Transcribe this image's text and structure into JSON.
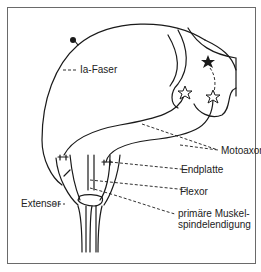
{
  "figure": {
    "labels": {
      "ia_faser": "Ia-Faser",
      "motoaxone": "Motoaxone",
      "endplatte": "Endplatte",
      "extensor": "Extensor",
      "flexor": "Flexor",
      "spindle_line1": "primäre Muskel-",
      "spindle_line2": "spindelendigung"
    },
    "colors": {
      "line": "#1a1a1a",
      "frame": "#6a6a6a",
      "background": "#ffffff"
    }
  }
}
